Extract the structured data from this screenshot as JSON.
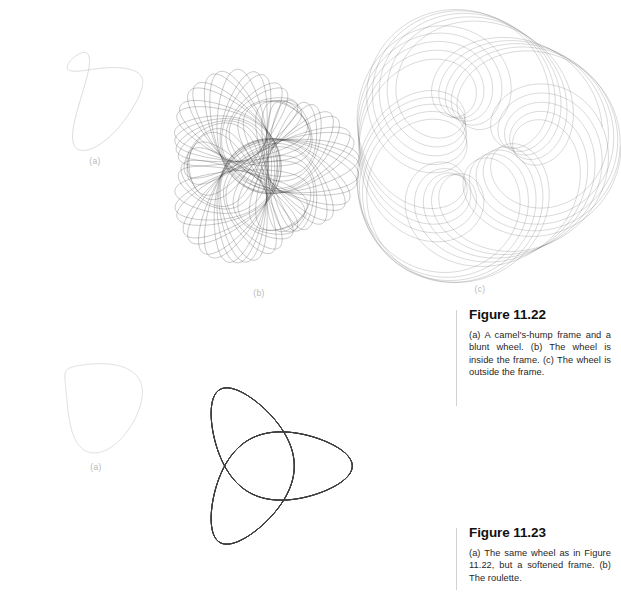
{
  "page": {
    "background": "#ffffff",
    "ink": "#2b2b2b",
    "faint_ink": "#c9c9c9",
    "rule_color": "#d2d2d2",
    "width": 621,
    "height": 593
  },
  "labels": {
    "a": "(a)",
    "b": "(b)",
    "c": "(c)"
  },
  "figures": [
    {
      "id": "fig-11-22",
      "number": "Figure 11.22",
      "heading": "Figure 11.22",
      "body": "(a) A camel's-hump frame and a blunt wheel. (b) The wheel is inside the frame. (c) The wheel is outside the frame.",
      "panels": [
        {
          "label": "(a)",
          "role": "frame-and-wheel",
          "description": "camel's-hump frame"
        },
        {
          "label": "(b)",
          "role": "roulette-inside",
          "description": "wheel is inside the frame"
        },
        {
          "label": "(c)",
          "role": "roulette-outside",
          "description": "wheel is outside the frame"
        }
      ]
    },
    {
      "id": "fig-11-23",
      "number": "Figure 11.23",
      "heading": "Figure 11.23",
      "body": "(a) The same wheel as in Figure 11.22, but a softened frame. (b) The roulette.",
      "panels": [
        {
          "label": "(a)",
          "role": "frame-softened",
          "description": "softened frame"
        },
        {
          "label": "(b)",
          "role": "roulette",
          "description": "the roulette"
        }
      ]
    }
  ],
  "chart_data": {
    "type": "line",
    "xlabel": "",
    "ylabel": "",
    "panels": [
      {
        "name": "fig1122-a-frame",
        "kind": "closed-curve",
        "stroke": "#c9c9c9",
        "stroke_width": 0.7,
        "viewbox": [
          0,
          0,
          120,
          130
        ],
        "generator": "fourier",
        "harmonics": {
          "ax": [
            0.0,
            34.0,
            8.0,
            -3.5,
            1.2
          ],
          "bx": [
            0.0,
            6.0,
            -4.5,
            2.0,
            -0.8
          ],
          "ay": [
            0.0,
            4.0,
            -22.0,
            6.0,
            -2.0
          ],
          "by": [
            0.0,
            38.0,
            5.0,
            -3.0,
            1.0
          ]
        },
        "center": [
          62,
          64
        ],
        "samples": 720,
        "rotation_deg": 14
      },
      {
        "name": "fig1122-b-roulette-inside",
        "kind": "roulette",
        "stroke": "#3a3a3a",
        "stroke_width": 0.38,
        "opacity": 0.72,
        "viewbox": [
          0,
          0,
          230,
          240
        ],
        "center": [
          112,
          116
        ],
        "frame_radius": 64,
        "frame_lobes": 3,
        "frame_amp": 0.27,
        "wheel_radius": 25,
        "pen_offset": 46,
        "turns": 46,
        "ratio": 0.3727,
        "samples": 5200,
        "mode": "inside"
      },
      {
        "name": "fig1122-c-roulette-outside",
        "kind": "roulette",
        "stroke": "#333333",
        "stroke_width": 0.3,
        "opacity": 0.62,
        "viewbox": [
          0,
          0,
          220,
          250
        ],
        "center": [
          110,
          120
        ],
        "frame_radius": 60,
        "frame_lobes": 3,
        "frame_amp": 0.2,
        "wheel_radius": 17,
        "pen_offset": 54,
        "turns": 78,
        "ratio": 0.1273,
        "samples": 9000,
        "mode": "outside"
      },
      {
        "name": "fig1123-a-frame",
        "kind": "closed-curve",
        "stroke": "#cdcdcd",
        "stroke_width": 0.7,
        "viewbox": [
          0,
          0,
          120,
          130
        ],
        "generator": "fourier",
        "harmonics": {
          "ax": [
            0.0,
            40.0,
            2.0,
            -1.0,
            0.3
          ],
          "bx": [
            0.0,
            2.0,
            -2.0,
            0.6,
            -0.2
          ],
          "ay": [
            0.0,
            1.0,
            -9.0,
            1.5,
            -0.4
          ],
          "by": [
            0.0,
            44.0,
            1.5,
            -0.8,
            0.2
          ]
        },
        "center": [
          60,
          62
        ],
        "samples": 720,
        "rotation_deg": 8
      },
      {
        "name": "fig1123-b-roulette",
        "kind": "roulette",
        "stroke": "#3a3a3a",
        "stroke_width": 0.36,
        "opacity": 0.7,
        "viewbox": [
          0,
          0,
          230,
          240
        ],
        "center": [
          112,
          118
        ],
        "frame_radius": 58,
        "frame_lobes": 3,
        "frame_amp": 0.16,
        "wheel_radius": 29,
        "pen_offset": 50,
        "turns": 38,
        "ratio": 0.5128,
        "samples": 4600,
        "mode": "inside"
      }
    ]
  }
}
